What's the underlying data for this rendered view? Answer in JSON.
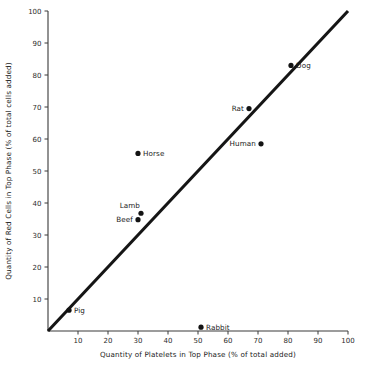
{
  "chart_data": {
    "type": "scatter",
    "title": "",
    "xlabel": "Quantity of Platelets in Top Phase (% of total added)",
    "ylabel": "Quantity of Red Cells in Top Phase (% of total cells added)",
    "xlim": [
      0,
      100
    ],
    "ylim": [
      0,
      100
    ],
    "grid": false,
    "legend": "none",
    "xticks": [
      10,
      20,
      30,
      40,
      50,
      60,
      70,
      80,
      90,
      100
    ],
    "yticks": [
      10,
      20,
      30,
      40,
      50,
      60,
      70,
      80,
      90,
      100
    ],
    "xtick_labels": [
      "10",
      "20",
      "30",
      "40",
      "50",
      "60",
      "70",
      "80",
      "90",
      "100"
    ],
    "ytick_labels": [
      "10",
      "20",
      "30",
      "40",
      "50",
      "60",
      "70",
      "80",
      "90",
      "100"
    ],
    "reference_line": {
      "name": "identity-line",
      "from": [
        0,
        0
      ],
      "to": [
        100,
        100
      ],
      "style": "solid",
      "color": "#151515"
    },
    "points": [
      {
        "label": "Pig",
        "x": 7,
        "y": 6.5,
        "label_pos": "right"
      },
      {
        "label": "Rabbit",
        "x": 51,
        "y": 1.2,
        "label_pos": "right"
      },
      {
        "label": "Beef",
        "x": 30,
        "y": 34.8,
        "label_pos": "left"
      },
      {
        "label": "Lamb",
        "x": 31,
        "y": 36.8,
        "label_pos": "above-left"
      },
      {
        "label": "Horse",
        "x": 30,
        "y": 55.5,
        "label_pos": "right"
      },
      {
        "label": "Human",
        "x": 71,
        "y": 58.5,
        "label_pos": "left"
      },
      {
        "label": "Rat",
        "x": 67,
        "y": 69.5,
        "label_pos": "left"
      },
      {
        "label": "Dog",
        "x": 81,
        "y": 83,
        "label_pos": "right"
      }
    ]
  },
  "colors": {
    "background": "#ffffff",
    "axis": "#3a3a3a",
    "line": "#151515",
    "marker": "#131313",
    "text": "#1a1a1a"
  }
}
